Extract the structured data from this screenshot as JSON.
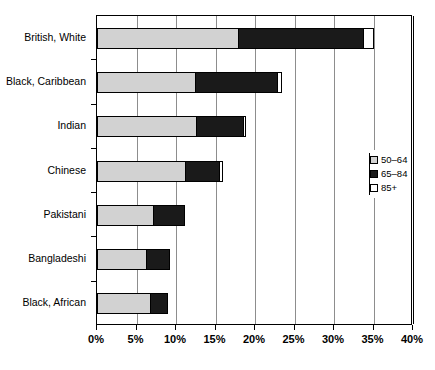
{
  "chart_data": {
    "type": "bar",
    "orientation": "horizontal",
    "stacked": true,
    "title": "",
    "xlabel": "",
    "ylabel": "",
    "xlim": [
      0,
      40
    ],
    "xtick_labels": [
      "0%",
      "5%",
      "10%",
      "15%",
      "20%",
      "25%",
      "30%",
      "35%",
      "40%"
    ],
    "xticks": [
      0,
      5,
      10,
      15,
      20,
      25,
      30,
      35,
      40
    ],
    "grid": "vertical",
    "legend_position": "right",
    "categories": [
      "British, White",
      "Black, Caribbean",
      "Indian",
      "Chinese",
      "Pakistani",
      "Bangladeshi",
      "Black, African"
    ],
    "series": [
      {
        "name": "50–64",
        "color": "#d2d2d2",
        "values": [
          18.0,
          12.5,
          12.7,
          11.3,
          7.2,
          6.3,
          6.8
        ]
      },
      {
        "name": "65–84",
        "color": "#1a1a1a",
        "values": [
          16.0,
          10.5,
          6.0,
          4.4,
          4.1,
          3.1,
          2.3
        ]
      },
      {
        "name": "85+",
        "color": "#ffffff",
        "values": [
          1.3,
          0.7,
          0.5,
          0.5,
          0.0,
          0.0,
          0.0
        ]
      }
    ],
    "totals": [
      35.3,
      23.7,
      19.2,
      16.2,
      11.3,
      9.4,
      9.1
    ]
  },
  "legend": {
    "items": [
      {
        "label": "50–64",
        "swatch": "swatch-grey"
      },
      {
        "label": "65–84",
        "swatch": "swatch-black"
      },
      {
        "label": "85+",
        "swatch": "swatch-white"
      }
    ]
  }
}
